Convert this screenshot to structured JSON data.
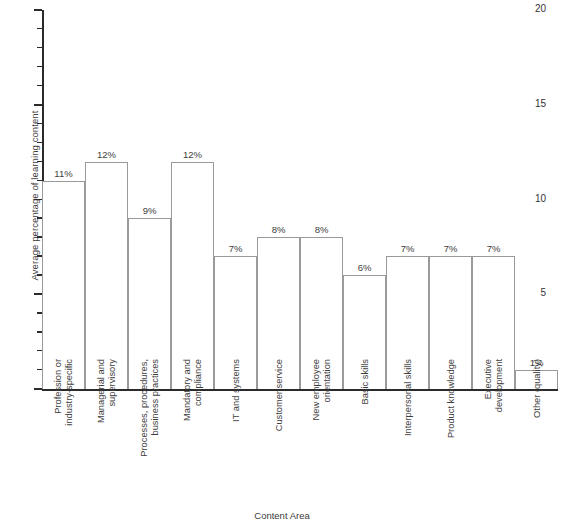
{
  "chart_data": {
    "type": "bar",
    "title": "",
    "xlabel": "Content Area",
    "ylabel": "Average percentage of learning content",
    "categories": [
      "Profession or\nindustry-specific",
      "Managerial and\nsupervisory",
      "Processes, procedures,\nbusiness practices",
      "Mandatory and\ncompliance",
      "IT and systems",
      "Customer service",
      "New employee\norientation",
      "Basic skills",
      "Interpersonal skills",
      "Product knowledge",
      "Executive\ndevelopment",
      "Other (quality)"
    ],
    "values": [
      11,
      12,
      9,
      12,
      7,
      8,
      8,
      6,
      7,
      7,
      7,
      1
    ],
    "value_labels": [
      "11%",
      "12%",
      "9%",
      "12%",
      "7%",
      "8%",
      "8%",
      "6%",
      "7%",
      "7%",
      "7%",
      "1%"
    ],
    "ylim": [
      0,
      20
    ],
    "ytick_labels": [
      "0",
      "5",
      "10",
      "15",
      "20"
    ],
    "ytick_values": [
      0,
      5,
      10,
      15,
      20
    ],
    "yminor_step": 1,
    "grid": false,
    "legend": null,
    "bar_fill": "#ffffff",
    "bar_stroke": "#9a9a9a",
    "axis_color": "#2b2b2b",
    "text_color": "#3d3d3d"
  }
}
